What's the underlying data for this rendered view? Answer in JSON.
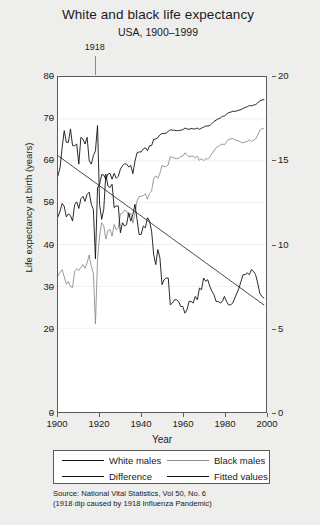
{
  "title": "White and black life expectancy",
  "subtitle": "USA, 1900–1999",
  "annotation": {
    "label": "1918",
    "year": 1918
  },
  "axes": {
    "xlabel": "Year",
    "ylabel": "Life expectancy at birth (years)",
    "xticks": [
      "1900",
      "1920",
      "1940",
      "1960",
      "1980",
      "2000"
    ],
    "yticks_left": [
      "0",
      "20",
      "30",
      "40",
      "50",
      "60",
      "70",
      "80"
    ],
    "yticks_right": [
      "0",
      "5",
      "10",
      "15",
      "20"
    ]
  },
  "legend": {
    "items": [
      {
        "label": "White males",
        "color": "#111111"
      },
      {
        "label": "Black males",
        "color": "#8d8d8d"
      },
      {
        "label": "Difference",
        "color": "#111111"
      },
      {
        "label": "Fitted values",
        "color": "#111111"
      }
    ]
  },
  "source": "Source: National Vital Statistics, Vol 50, No. 6\n(1918 dip caused by 1918 Influenza Pandemic)",
  "colors": {
    "white_males": "#111111",
    "black_males": "#8d8d8d",
    "difference": "#111111",
    "fitted": "#111111",
    "grid": "#f0f0f0",
    "frame": "#5a5a5a",
    "background": "#eeeeec",
    "plot_background": "#ffffff"
  },
  "chart_data": {
    "type": "line",
    "title": "White and black life expectancy",
    "subtitle": "USA, 1900–1999",
    "xlabel": "Year",
    "ylabel": "Life expectancy at birth (years)",
    "ylabel_right": "Difference (years)",
    "xlim": [
      1900,
      2000
    ],
    "ylim": [
      0,
      80
    ],
    "ylim_right": [
      0,
      20
    ],
    "grid": true,
    "legend_position": "below",
    "x": [
      1900,
      1901,
      1902,
      1903,
      1904,
      1905,
      1906,
      1907,
      1908,
      1909,
      1910,
      1911,
      1912,
      1913,
      1914,
      1915,
      1916,
      1917,
      1918,
      1919,
      1920,
      1921,
      1922,
      1923,
      1924,
      1925,
      1926,
      1927,
      1928,
      1929,
      1930,
      1931,
      1932,
      1933,
      1934,
      1935,
      1936,
      1937,
      1938,
      1939,
      1940,
      1941,
      1942,
      1943,
      1944,
      1945,
      1946,
      1947,
      1948,
      1949,
      1950,
      1951,
      1952,
      1953,
      1954,
      1955,
      1956,
      1957,
      1958,
      1959,
      1960,
      1961,
      1962,
      1963,
      1964,
      1965,
      1966,
      1967,
      1968,
      1969,
      1970,
      1971,
      1972,
      1973,
      1974,
      1975,
      1976,
      1977,
      1978,
      1979,
      1980,
      1981,
      1982,
      1983,
      1984,
      1985,
      1986,
      1987,
      1988,
      1989,
      1990,
      1991,
      1992,
      1993,
      1994,
      1995,
      1996,
      1997,
      1998,
      1999
    ],
    "series": [
      {
        "name": "White males",
        "axis": "left",
        "color": "#111111",
        "values": [
          46.6,
          48.0,
          49.8,
          49.1,
          46.6,
          47.3,
          46.9,
          45.6,
          49.5,
          50.2,
          48.6,
          50.9,
          51.5,
          50.3,
          52.0,
          52.5,
          49.6,
          48.4,
          36.6,
          53.5,
          54.4,
          56.7,
          56.6,
          55.5,
          56.8,
          57.0,
          55.6,
          57.0,
          55.8,
          56.3,
          58.0,
          58.8,
          59.3,
          59.2,
          58.5,
          58.9,
          56.9,
          59.9,
          61.9,
          62.1,
          62.1,
          62.8,
          63.1,
          62.4,
          63.6,
          63.6,
          65.1,
          65.2,
          65.5,
          66.2,
          66.5,
          66.5,
          66.6,
          67.0,
          67.4,
          67.3,
          67.3,
          67.2,
          67.2,
          67.3,
          67.4,
          67.8,
          67.6,
          67.5,
          67.7,
          67.6,
          67.6,
          67.8,
          67.5,
          67.8,
          68.0,
          68.3,
          68.3,
          68.4,
          68.9,
          69.4,
          69.7,
          70.0,
          70.2,
          70.6,
          70.7,
          71.1,
          71.5,
          71.6,
          71.8,
          71.8,
          71.9,
          72.1,
          72.2,
          72.5,
          72.7,
          72.9,
          73.2,
          73.1,
          73.3,
          73.4,
          73.8,
          74.3,
          74.5,
          74.6
        ]
      },
      {
        "name": "Black males",
        "axis": "left",
        "color": "#8d8d8d",
        "values": [
          32.5,
          33.4,
          34.0,
          32.3,
          30.5,
          31.2,
          30.0,
          29.7,
          33.6,
          34.2,
          33.8,
          34.5,
          35.2,
          34.3,
          35.6,
          37.5,
          34.8,
          33.1,
          21.0,
          36.4,
          42.0,
          45.2,
          44.5,
          41.3,
          43.3,
          43.6,
          42.0,
          44.8,
          43.5,
          44.0,
          47.3,
          47.5,
          48.2,
          48.0,
          46.6,
          47.5,
          45.1,
          47.5,
          50.4,
          51.5,
          51.5,
          51.7,
          52.1,
          50.8,
          52.2,
          52.8,
          55.7,
          56.4,
          55.8,
          57.0,
          58.9,
          58.6,
          58.6,
          59.0,
          61.0,
          60.8,
          60.6,
          60.5,
          60.6,
          61.0,
          61.1,
          61.9,
          61.5,
          60.9,
          61.1,
          61.1,
          60.7,
          61.1,
          60.1,
          60.5,
          60.0,
          60.5,
          60.4,
          60.9,
          61.7,
          62.4,
          63.1,
          63.4,
          63.7,
          64.0,
          63.8,
          64.5,
          65.1,
          65.2,
          65.3,
          65.0,
          64.8,
          64.7,
          64.4,
          64.3,
          64.5,
          64.6,
          65.0,
          64.6,
          64.9,
          65.2,
          66.1,
          67.2,
          67.6,
          67.8
        ]
      },
      {
        "name": "Difference",
        "axis": "right",
        "color": "#111111",
        "values": [
          14.1,
          14.6,
          15.8,
          16.8,
          16.1,
          16.1,
          16.9,
          15.9,
          15.9,
          16.0,
          14.8,
          16.4,
          16.3,
          16.0,
          16.4,
          15.0,
          14.8,
          15.3,
          15.6,
          17.1,
          12.4,
          11.5,
          12.1,
          14.2,
          13.5,
          13.4,
          13.6,
          12.2,
          12.3,
          12.3,
          10.7,
          11.3,
          11.1,
          11.2,
          11.9,
          11.4,
          11.8,
          12.4,
          11.5,
          10.6,
          10.6,
          11.1,
          11.0,
          11.6,
          11.4,
          10.8,
          9.4,
          8.8,
          9.7,
          9.2,
          7.6,
          7.9,
          8.0,
          8.0,
          6.4,
          6.5,
          6.7,
          6.7,
          6.6,
          6.3,
          6.3,
          5.9,
          6.1,
          6.6,
          6.6,
          6.5,
          6.9,
          6.7,
          7.4,
          7.3,
          8.0,
          7.8,
          7.9,
          7.5,
          7.2,
          7.0,
          6.6,
          6.6,
          6.5,
          6.6,
          6.9,
          6.6,
          6.4,
          6.4,
          6.5,
          6.8,
          7.1,
          7.4,
          7.8,
          8.2,
          8.2,
          8.3,
          8.2,
          8.5,
          8.4,
          8.2,
          7.7,
          7.1,
          6.9,
          6.8
        ]
      },
      {
        "name": "Fitted values",
        "axis": "right",
        "color": "#111111",
        "fit": "linear",
        "values": [
          15.3,
          15.21,
          15.12,
          15.03,
          14.94,
          14.85,
          14.76,
          14.67,
          14.58,
          14.49,
          14.4,
          14.31,
          14.22,
          14.13,
          14.04,
          13.95,
          13.86,
          13.77,
          13.68,
          13.59,
          13.5,
          13.41,
          13.32,
          13.23,
          13.14,
          13.05,
          12.96,
          12.87,
          12.78,
          12.69,
          12.6,
          12.51,
          12.42,
          12.33,
          12.24,
          12.15,
          12.06,
          11.97,
          11.88,
          11.79,
          11.7,
          11.61,
          11.52,
          11.43,
          11.34,
          11.25,
          11.16,
          11.07,
          10.98,
          10.89,
          10.8,
          10.71,
          10.62,
          10.53,
          10.44,
          10.35,
          10.26,
          10.17,
          10.08,
          9.99,
          9.9,
          9.81,
          9.72,
          9.63,
          9.54,
          9.45,
          9.36,
          9.27,
          9.18,
          9.09,
          9.0,
          8.91,
          8.82,
          8.73,
          8.64,
          8.55,
          8.46,
          8.37,
          8.28,
          8.19,
          8.1,
          8.01,
          7.92,
          7.83,
          7.74,
          7.65,
          7.56,
          7.47,
          7.38,
          7.29,
          7.2,
          7.11,
          7.02,
          6.93,
          6.84,
          6.75,
          6.66,
          6.57,
          6.48,
          6.39
        ]
      }
    ]
  }
}
